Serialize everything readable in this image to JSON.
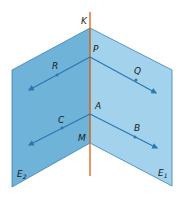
{
  "diagram": {
    "type": "two intersecting half-planes with parallel lines",
    "colors": {
      "plane_left": "#6fb3d9",
      "plane_right": "#9fd0ec",
      "edge": "#3b82b5",
      "axis_line": "#e06b1f",
      "vector_line": "#2a78b0"
    },
    "labels": {
      "K": "K",
      "P": "P",
      "A": "A",
      "M": "M",
      "R": "R",
      "Q": "Q",
      "C": "C",
      "B": "B",
      "E2_main": "E",
      "E2_sub": "2",
      "E1_main": "E",
      "E1_sub": "1"
    }
  }
}
